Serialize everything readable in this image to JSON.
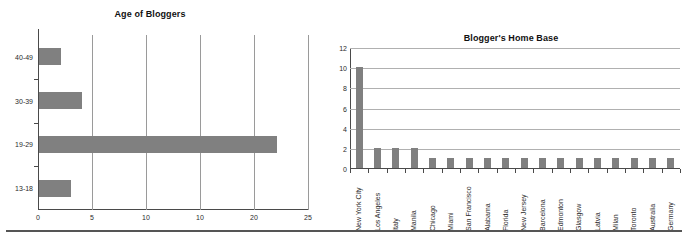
{
  "chart_data": [
    {
      "type": "bar",
      "orientation": "horizontal",
      "title": "Age of Bloggers",
      "xlabel": "",
      "ylabel": "",
      "categories": [
        "40-49",
        "30-39",
        "19-29",
        "13-18"
      ],
      "values": [
        2,
        4,
        22,
        3
      ],
      "xticks": [
        "0",
        "5",
        "10",
        "10",
        "20",
        "25"
      ],
      "xtick_values": [
        0,
        5,
        10,
        15,
        20,
        25
      ],
      "xlim": [
        0,
        25
      ],
      "grid": "vertical",
      "legend": "none",
      "bar_color": "#808080"
    },
    {
      "type": "bar",
      "orientation": "vertical",
      "title": "Blogger's Home Base",
      "xlabel": "",
      "ylabel": "",
      "categories": [
        "New York City",
        "Los Angeles",
        "Italy",
        "Manila",
        "Chicago",
        "Miami",
        "San Francisco",
        "Alabama",
        "Florida",
        "New Jersey",
        "Barcelona",
        "Edmonton",
        "Glasgow",
        "Latvia",
        "Milan",
        "Toronto",
        "Australia",
        "Germany"
      ],
      "values": [
        10,
        2,
        2,
        2,
        1,
        1,
        1,
        1,
        1,
        1,
        1,
        1,
        1,
        1,
        1,
        1,
        1,
        1
      ],
      "yticks": [
        "0",
        "2",
        "4",
        "6",
        "8",
        "10",
        "12"
      ],
      "ytick_values": [
        0,
        2,
        4,
        6,
        8,
        10,
        12
      ],
      "ylim": [
        0,
        12
      ],
      "grid": "horizontal",
      "legend": "none",
      "bar_color": "#808080"
    }
  ]
}
